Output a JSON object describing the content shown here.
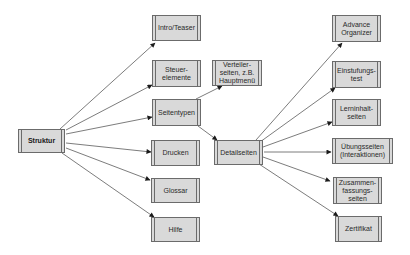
{
  "diagram": {
    "type": "tree",
    "root": {
      "id": "struktur",
      "label": "Struktur",
      "box": [
        18,
        129,
        47,
        24
      ]
    },
    "nodes": [
      {
        "id": "intro",
        "label": "Intro/Teaser",
        "box": [
          152,
          15,
          49,
          26
        ]
      },
      {
        "id": "steuer",
        "label": "Steuer-\nelemente",
        "box": [
          152,
          60,
          49,
          27
        ]
      },
      {
        "id": "seitentypen",
        "label": "Seitentypen",
        "box": [
          152,
          99,
          49,
          27
        ]
      },
      {
        "id": "drucken",
        "label": "Drucken",
        "box": [
          151,
          140,
          49,
          26
        ]
      },
      {
        "id": "glossar",
        "label": "Glossar",
        "box": [
          151,
          178,
          49,
          25
        ]
      },
      {
        "id": "hilfe",
        "label": "Hilfe",
        "box": [
          151,
          217,
          49,
          25
        ]
      },
      {
        "id": "verteiler",
        "label": "Verteiler-\nseiten, z.B.\nHauptmenü",
        "box": [
          212,
          60,
          50,
          26
        ]
      },
      {
        "id": "detailseiten",
        "label": "Detailseiten",
        "box": [
          214,
          140,
          49,
          25
        ]
      },
      {
        "id": "advance",
        "label": "Advance\nOrganizer",
        "box": [
          332,
          15,
          49,
          27
        ]
      },
      {
        "id": "einstufung",
        "label": "Einstufungs-\ntest",
        "box": [
          332,
          61,
          49,
          27
        ]
      },
      {
        "id": "lerninhalt",
        "label": "Lerninhalt-\nseiten",
        "box": [
          332,
          99,
          49,
          27
        ]
      },
      {
        "id": "uebung",
        "label": "Übungsseiten\n(Interaktionen)",
        "box": [
          332,
          138,
          61,
          26
        ]
      },
      {
        "id": "zusammen",
        "label": "Zusammen-\nfassungs-\nseiten",
        "box": [
          333,
          177,
          49,
          27
        ]
      },
      {
        "id": "zertifikat",
        "label": "Zertifikat",
        "box": [
          335,
          216,
          47,
          26
        ]
      }
    ],
    "edges": [
      {
        "from": "struktur",
        "to": "intro",
        "line": [
          60,
          129,
          155,
          43
        ]
      },
      {
        "from": "struktur",
        "to": "steuer",
        "line": [
          66,
          130,
          152,
          85
        ]
      },
      {
        "from": "struktur",
        "to": "seitentypen",
        "line": [
          66,
          134,
          152,
          117
        ]
      },
      {
        "from": "struktur",
        "to": "drucken",
        "line": [
          66,
          143,
          151,
          152
        ]
      },
      {
        "from": "struktur",
        "to": "glossar",
        "line": [
          66,
          148,
          150,
          180
        ]
      },
      {
        "from": "struktur",
        "to": "hilfe",
        "line": [
          62,
          153,
          154,
          217
        ]
      },
      {
        "from": "seitentypen",
        "to": "verteiler",
        "line": [
          196,
          99,
          222,
          86
        ]
      },
      {
        "from": "seitentypen",
        "to": "detailseiten",
        "line": [
          198,
          126,
          217,
          140
        ]
      },
      {
        "from": "detailseiten",
        "to": "advance",
        "line": [
          256,
          140,
          342,
          43
        ]
      },
      {
        "from": "detailseiten",
        "to": "einstufung",
        "line": [
          260,
          142,
          335,
          88
        ]
      },
      {
        "from": "detailseiten",
        "to": "lerninhalt",
        "line": [
          263,
          147,
          332,
          122
        ]
      },
      {
        "from": "detailseiten",
        "to": "uebung",
        "line": [
          264,
          152,
          331,
          152
        ]
      },
      {
        "from": "detailseiten",
        "to": "zusammen",
        "line": [
          263,
          157,
          330,
          181
        ]
      },
      {
        "from": "detailseiten",
        "to": "zertifikat",
        "line": [
          259,
          164,
          338,
          216
        ]
      }
    ],
    "colors": {
      "box_fill": "#d9d9d9",
      "box_border": "#6b6b6b",
      "edge": "#5a5a5a",
      "arrowhead": "#1a1a1a"
    }
  }
}
